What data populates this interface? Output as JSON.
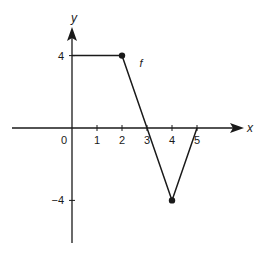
{
  "chart_data": {
    "type": "line",
    "title": "",
    "xlabel": "x",
    "ylabel": "y",
    "function_label": "f",
    "series": [
      {
        "name": "f",
        "points": [
          [
            0,
            4
          ],
          [
            2,
            4
          ],
          [
            4,
            -4
          ],
          [
            5,
            0
          ]
        ],
        "marked_points": [
          [
            2,
            4
          ],
          [
            4,
            -4
          ]
        ]
      }
    ],
    "x_ticks": [
      0,
      1,
      2,
      3,
      4,
      5
    ],
    "x_tick_labels": [
      "0",
      "1",
      "2",
      "3",
      "4",
      "5"
    ],
    "y_ticks": [
      4,
      -4
    ],
    "y_tick_labels": [
      "4",
      "−4"
    ],
    "xlim": [
      -2.4,
      6.8
    ],
    "ylim": [
      -6.3,
      5.5
    ],
    "grid": false,
    "legend": "none"
  },
  "colors": {
    "ink": "#1a1a1a",
    "background": "#ffffff"
  }
}
